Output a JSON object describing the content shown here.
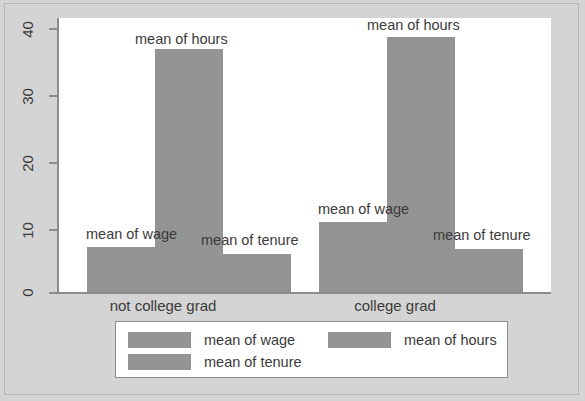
{
  "chart_data": {
    "type": "bar",
    "title": "",
    "xlabel": "",
    "ylabel": "",
    "ylim": [
      0,
      41
    ],
    "grid": false,
    "legend_position": "bottom",
    "categories": [
      "not college grad",
      "college grad"
    ],
    "series": [
      {
        "name": "mean of wage",
        "values": [
          6.7,
          10.4
        ],
        "color": "#949494"
      },
      {
        "name": "mean of hours",
        "values": [
          36.4,
          38.1
        ],
        "color": "#949494"
      },
      {
        "name": "mean of tenure",
        "values": [
          5.7,
          6.4
        ],
        "color": "#949494"
      }
    ],
    "y_ticks": [
      "0",
      "10",
      "20",
      "30",
      "40"
    ],
    "y_tick_values": [
      0,
      10,
      20,
      30,
      40
    ],
    "bar_annotations": [
      "mean of wage",
      "mean of hours",
      "mean of tenure",
      "mean of wage",
      "mean of hours",
      "mean of tenure"
    ]
  },
  "axis": {
    "y_ticks": [
      {
        "label": "40",
        "value": 40
      },
      {
        "label": "30",
        "value": 30
      },
      {
        "label": "20",
        "value": 20
      },
      {
        "label": "10",
        "value": 10
      },
      {
        "label": "0",
        "value": 0
      }
    ],
    "x_categories": [
      {
        "label": "not college grad"
      },
      {
        "label": "college grad"
      }
    ]
  },
  "bar_labels": {
    "g1_wage": "mean of wage",
    "g1_hours": "mean of hours",
    "g1_tenure": "mean of tenure",
    "g2_wage": "mean of wage",
    "g2_hours": "mean of hours",
    "g2_tenure": "mean of tenure"
  },
  "legend": {
    "items": [
      {
        "label": "mean of wage",
        "color": "#949494"
      },
      {
        "label": "mean of hours",
        "color": "#949494"
      },
      {
        "label": "mean of tenure",
        "color": "#949494"
      }
    ]
  },
  "colors": {
    "bar": "#949494",
    "page_background": "#d4d4d4",
    "plot_background": "#ffffff",
    "axis": "#8c8c8c",
    "text": "#3b3b3b"
  }
}
